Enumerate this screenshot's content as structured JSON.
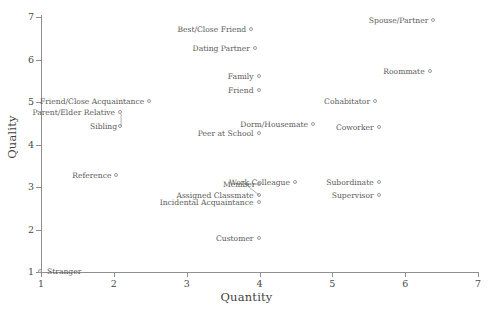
{
  "chart_data": {
    "type": "scatter",
    "title": "",
    "xlabel": "Quantity",
    "ylabel": "Quality",
    "xlim": [
      1,
      7
    ],
    "ylim": [
      1,
      7
    ],
    "xticks": [
      "1",
      "2",
      "3",
      "4",
      "5",
      "6",
      "7"
    ],
    "yticks": [
      "1",
      "2",
      "3",
      "4",
      "5",
      "6",
      "7"
    ],
    "grid": false,
    "legend": "none",
    "marker_style": "open-circle",
    "marker_color": "#9a9a9a",
    "axis_color": "#8f8f8f",
    "text_color": "#5a5a5a",
    "points": [
      {
        "label": "Spouse/Partner",
        "x": 6.4,
        "y": 6.9,
        "label_side": "left"
      },
      {
        "label": "Best/Close Friend",
        "x": 3.9,
        "y": 6.7,
        "label_side": "left"
      },
      {
        "label": "Dating Partner",
        "x": 3.95,
        "y": 6.25,
        "label_side": "left"
      },
      {
        "label": "Roommate",
        "x": 6.35,
        "y": 5.7,
        "label_side": "left"
      },
      {
        "label": "Family",
        "x": 4.0,
        "y": 5.6,
        "label_side": "left"
      },
      {
        "label": "Friend",
        "x": 4.0,
        "y": 5.25,
        "label_side": "left"
      },
      {
        "label": "Cohabitator",
        "x": 5.6,
        "y": 5.0,
        "label_side": "left"
      },
      {
        "label": "Friend/Close Acquaintance",
        "x": 2.5,
        "y": 5.0,
        "label_side": "left"
      },
      {
        "label": "Parent/Elder Relative",
        "x": 2.1,
        "y": 4.75,
        "label_side": "left"
      },
      {
        "label": "Dorm/Housemate",
        "x": 4.75,
        "y": 4.45,
        "label_side": "left"
      },
      {
        "label": "Coworker",
        "x": 5.65,
        "y": 4.4,
        "label_side": "left"
      },
      {
        "label": "Sibling",
        "x": 2.1,
        "y": 4.42,
        "label_side": "leader"
      },
      {
        "label": "Peer at School",
        "x": 4.0,
        "y": 4.25,
        "label_side": "left"
      },
      {
        "label": "Reference",
        "x": 2.05,
        "y": 3.25,
        "label_side": "left"
      },
      {
        "label": "Work Colleague",
        "x": 4.5,
        "y": 3.1,
        "label_side": "left"
      },
      {
        "label": "Subordinate",
        "x": 5.65,
        "y": 3.1,
        "label_side": "left"
      },
      {
        "label": "Member",
        "x": 4.0,
        "y": 3.05,
        "label_side": "leader"
      },
      {
        "label": "Supervisor",
        "x": 5.65,
        "y": 2.8,
        "label_side": "left"
      },
      {
        "label": "Assigned Classmate",
        "x": 4.0,
        "y": 2.78,
        "label_side": "left"
      },
      {
        "label": "Incidental Acquaintance",
        "x": 4.0,
        "y": 2.62,
        "label_side": "left"
      },
      {
        "label": "Customer",
        "x": 4.0,
        "y": 1.78,
        "label_side": "left"
      },
      {
        "label": "Stranger",
        "x": 1.0,
        "y": 1.0,
        "label_side": "right"
      }
    ],
    "leader_lines": [
      {
        "from_label": "Sibling",
        "x1": 2.1,
        "y1": 4.42,
        "x2": 2.1,
        "y2": 4.72
      },
      {
        "from_label": "Member",
        "x1": 3.82,
        "y1": 3.05,
        "x2": 4.0,
        "y2": 2.8
      }
    ]
  }
}
